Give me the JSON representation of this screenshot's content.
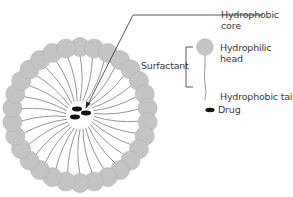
{
  "labels": {
    "hydrophobic_core": "Hydrophobic\ncore",
    "hydrophobic_core_line1": "Hydrophobic",
    "hydrophobic_core_line2": "core",
    "surfactant": "Surfactant",
    "hydrophilic_head_line1": "Hydrophilic",
    "hydrophilic_head_line2": "head",
    "hydrophobic_tail": "Hydrophobic tail",
    "drug": "Drug"
  },
  "micelle": {
    "center_x": 80,
    "center_y": 115,
    "head_ring_radius": 68,
    "head_radius": 9.5,
    "head_count": 30,
    "tail_inner_radius": 14,
    "drug_molecule_count": 3
  },
  "colors": {
    "head_fill": "#c4c4c4",
    "head_stroke": "#b2b2b2",
    "tail": "#8a8a8a",
    "drug": "#111111",
    "leader_line": "#444444",
    "text": "#3a3a3a"
  }
}
